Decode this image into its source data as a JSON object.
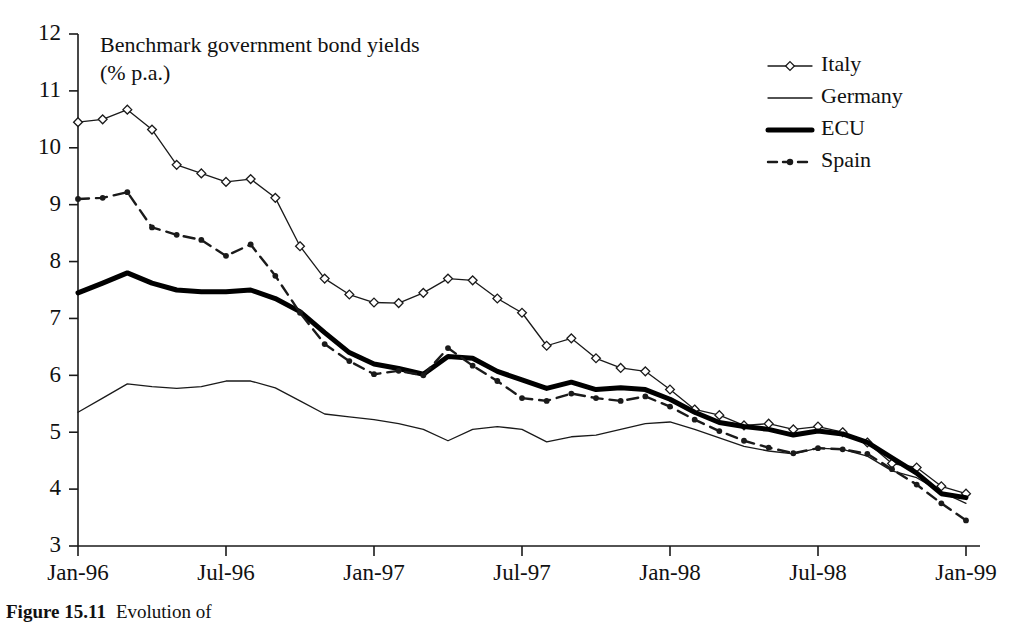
{
  "chart_data": {
    "type": "line",
    "title": "Benchmark government bond yields",
    "subtitle": "(% p.a.)",
    "xlabel": "",
    "ylabel": "",
    "ylim": [
      3,
      12
    ],
    "ytick_step": 1,
    "ytick_labels": [
      "3",
      "4",
      "5",
      "6",
      "7",
      "8",
      "9",
      "10",
      "11",
      "12"
    ],
    "grid": false,
    "legend_position": "top-right",
    "x": [
      "Jan-96",
      "Feb-96",
      "Mar-96",
      "Apr-96",
      "May-96",
      "Jun-96",
      "Jul-96",
      "Aug-96",
      "Sep-96",
      "Oct-96",
      "Nov-96",
      "Dec-96",
      "Jan-97",
      "Feb-97",
      "Mar-97",
      "Apr-97",
      "May-97",
      "Jun-97",
      "Jul-97",
      "Aug-97",
      "Sep-97",
      "Oct-97",
      "Nov-97",
      "Dec-97",
      "Jan-98",
      "Feb-98",
      "Mar-98",
      "Apr-98",
      "May-98",
      "Jun-98",
      "Jul-98",
      "Aug-98",
      "Sep-98",
      "Oct-98",
      "Nov-98",
      "Dec-98",
      "Jan-99"
    ],
    "xtick_labels": [
      "Jan-96",
      "Jul-96",
      "Jan-97",
      "Jul-97",
      "Jan-98",
      "Jul-98",
      "Jan-99"
    ],
    "xtick_indices": [
      0,
      6,
      12,
      18,
      24,
      30,
      36
    ],
    "series": [
      {
        "name": "Italy",
        "style": "thin-marker",
        "marker": "open-diamond",
        "color": "#1a1a1a",
        "stroke_width": 1.3,
        "values": [
          10.45,
          10.5,
          10.67,
          10.32,
          9.7,
          9.55,
          9.4,
          9.45,
          9.12,
          8.27,
          7.7,
          7.42,
          7.28,
          7.27,
          7.45,
          7.7,
          7.67,
          7.35,
          7.1,
          6.52,
          6.65,
          6.3,
          6.13,
          6.07,
          5.75,
          5.4,
          5.3,
          5.12,
          5.15,
          5.05,
          5.1,
          5.0,
          4.82,
          4.45,
          4.38,
          4.05,
          3.92
        ]
      },
      {
        "name": "Germany",
        "style": "thin",
        "marker": "none",
        "color": "#1a1a1a",
        "stroke_width": 1.3,
        "values": [
          5.35,
          5.6,
          5.85,
          5.8,
          5.77,
          5.8,
          5.9,
          5.9,
          5.78,
          5.55,
          5.32,
          5.27,
          5.22,
          5.15,
          5.05,
          4.85,
          5.05,
          5.1,
          5.05,
          4.83,
          4.92,
          4.95,
          5.05,
          5.15,
          5.18,
          5.05,
          4.9,
          4.75,
          4.67,
          4.62,
          4.72,
          4.7,
          4.58,
          4.32,
          4.2,
          3.95,
          3.75
        ]
      },
      {
        "name": "ECU",
        "style": "thick",
        "marker": "none",
        "color": "#000000",
        "stroke_width": 5.0,
        "values": [
          7.45,
          7.62,
          7.8,
          7.62,
          7.5,
          7.47,
          7.47,
          7.5,
          7.35,
          7.12,
          6.75,
          6.4,
          6.2,
          6.12,
          6.02,
          6.33,
          6.3,
          6.07,
          5.92,
          5.77,
          5.88,
          5.75,
          5.78,
          5.75,
          5.58,
          5.35,
          5.17,
          5.1,
          5.05,
          4.95,
          5.02,
          4.97,
          4.82,
          4.55,
          4.28,
          3.92,
          3.85
        ]
      },
      {
        "name": "Spain",
        "style": "dashed-marker",
        "marker": "small-dot",
        "color": "#1a1a1a",
        "stroke_width": 2.4,
        "values": [
          9.1,
          9.12,
          9.22,
          8.6,
          8.47,
          8.38,
          8.1,
          8.3,
          7.75,
          7.1,
          6.55,
          6.25,
          6.02,
          6.08,
          6.0,
          6.48,
          6.17,
          5.9,
          5.6,
          5.55,
          5.68,
          5.6,
          5.55,
          5.63,
          5.45,
          5.22,
          5.02,
          4.85,
          4.73,
          4.63,
          4.72,
          4.7,
          4.62,
          4.35,
          4.08,
          3.75,
          3.45
        ]
      }
    ]
  },
  "legend": {
    "entries": [
      {
        "label": "Italy"
      },
      {
        "label": "Germany"
      },
      {
        "label": "ECU"
      },
      {
        "label": "Spain"
      }
    ]
  },
  "caption": {
    "figure_number": "Figure 15.11",
    "text": "Evolution of"
  }
}
